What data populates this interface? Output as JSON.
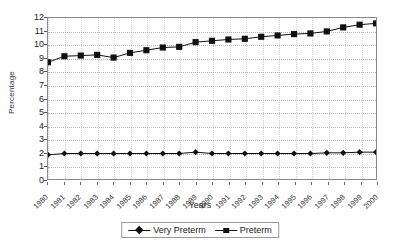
{
  "chart_data": {
    "type": "line",
    "title": "",
    "xlabel": "Years",
    "ylabel": "Percentage",
    "ylim": [
      0,
      12
    ],
    "ytick_step": 1,
    "yticks": [
      12,
      11,
      10,
      9,
      8,
      7,
      6,
      5,
      4,
      3,
      2,
      1,
      0
    ],
    "grid": true,
    "legend_position": "bottom",
    "categories": [
      "1980",
      "1981",
      "1982",
      "1983",
      "1984",
      "1985",
      "1986",
      "1987",
      "1988",
      "1989",
      "1990",
      "1991",
      "1992",
      "1993",
      "1994",
      "1995",
      "1996",
      "1997",
      "1998",
      "1999",
      "2000"
    ],
    "series": [
      {
        "name": "Very Preterm",
        "marker": "diamond",
        "color": "#111111",
        "values": [
          1.8,
          1.9,
          1.9,
          1.9,
          1.9,
          1.9,
          1.9,
          1.9,
          1.9,
          2.0,
          1.9,
          1.9,
          1.9,
          1.9,
          1.9,
          1.9,
          1.9,
          1.95,
          1.95,
          2.0,
          2.0
        ]
      },
      {
        "name": "Preterm",
        "marker": "square",
        "color": "#111111",
        "values": [
          8.7,
          9.15,
          9.2,
          9.25,
          9.05,
          9.4,
          9.6,
          9.8,
          9.85,
          10.2,
          10.3,
          10.4,
          10.45,
          10.6,
          10.7,
          10.8,
          10.85,
          11.0,
          11.3,
          11.5,
          11.6
        ]
      }
    ]
  },
  "legend": {
    "items": [
      {
        "label": "Very Preterm"
      },
      {
        "label": "Preterm"
      }
    ]
  },
  "axis_titles": {
    "x": "Years",
    "y": "Percentage"
  }
}
